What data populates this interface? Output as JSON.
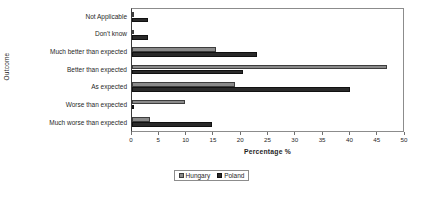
{
  "chart_data": {
    "type": "bar",
    "orientation": "horizontal",
    "title": "",
    "xlabel": "Percentage %",
    "ylabel": "Outcome",
    "xlim": [
      0,
      50
    ],
    "xticks": [
      0,
      5,
      10,
      15,
      20,
      25,
      30,
      35,
      40,
      45,
      50
    ],
    "grid": false,
    "legend_position": "bottom",
    "categories": [
      "Not Applicable",
      "Don't know",
      "Much better than expected",
      "Better than expected",
      "As expected",
      "Worse than expected",
      "Much worse than expected"
    ],
    "series": [
      {
        "name": "Hungary",
        "color": "#8a8a8a",
        "values": [
          0,
          0.3,
          15.5,
          47,
          19,
          9.7,
          3.3
        ]
      },
      {
        "name": "Poland",
        "color": "#2a2a2a",
        "values": [
          3,
          3,
          23,
          20.5,
          40.3,
          0.3,
          14.7
        ]
      }
    ]
  },
  "axis": {
    "x_title": "Percentage %",
    "y_title": "Outcome",
    "tick_labels": [
      "0",
      "5",
      "10",
      "15",
      "20",
      "25",
      "30",
      "35",
      "40",
      "45",
      "50"
    ]
  },
  "legend": {
    "entries": [
      {
        "label": "Hungary"
      },
      {
        "label": "Poland"
      }
    ]
  }
}
